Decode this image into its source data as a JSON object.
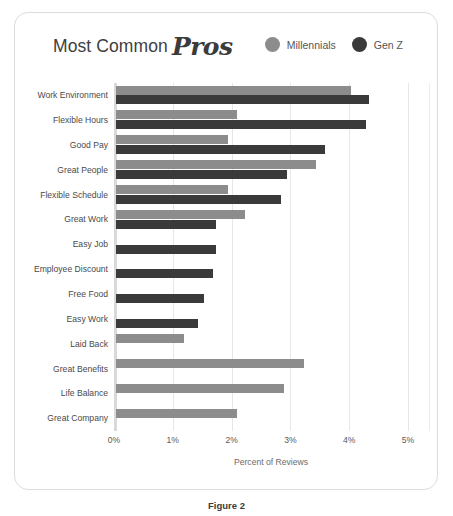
{
  "figure": {
    "caption": "Figure 2",
    "card_border_color": "#dcdcdc"
  },
  "header": {
    "title_plain": "Most Common",
    "title_script": "Pros"
  },
  "legend": {
    "position": "top-right",
    "items": [
      {
        "label": "Millennials",
        "color": "#8c8c8c",
        "icon": "circle-icon"
      },
      {
        "label": "Gen Z",
        "color": "#3a3a3a",
        "icon": "circle-icon"
      }
    ]
  },
  "chart_data": {
    "type": "bar",
    "orientation": "horizontal",
    "xlabel": "Percent of Reviews",
    "ylabel": "",
    "xlim": [
      0,
      5
    ],
    "grid": true,
    "legend_position": "top-right",
    "tick_labels": [
      "0%",
      "1%",
      "2%",
      "3%",
      "4%",
      "5%"
    ],
    "tick_values": [
      0,
      1,
      2,
      3,
      4,
      5
    ],
    "categories": [
      "Work Environment",
      "Flexible Hours",
      "Good Pay",
      "Great People",
      "Flexible Schedule",
      "Great Work",
      "Easy Job",
      "Employee Discount",
      "Free Food",
      "Easy Work",
      "Laid Back",
      "Great Benefits",
      "Life Balance",
      "Great Company"
    ],
    "series": [
      {
        "name": "Millennials",
        "color": "#8c8c8c",
        "values": [
          4.0,
          2.05,
          1.9,
          3.4,
          1.9,
          2.2,
          0,
          0,
          0,
          0,
          1.15,
          3.2,
          2.85,
          2.05
        ]
      },
      {
        "name": "Gen Z",
        "color": "#3a3a3a",
        "values": [
          4.3,
          4.25,
          3.55,
          2.9,
          2.8,
          1.7,
          1.7,
          1.65,
          1.5,
          1.4,
          0,
          0,
          0,
          0
        ]
      }
    ]
  }
}
